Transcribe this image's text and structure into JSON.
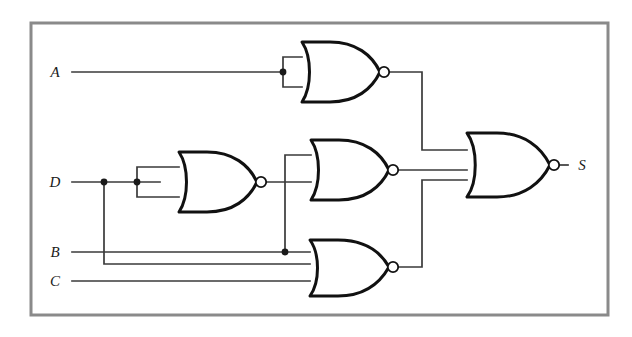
{
  "figure": {
    "kind": "logic-circuit-diagram",
    "title": "",
    "background_color": "#ffffff",
    "border_color": "#8a8a8a",
    "wire_color": "#3a3a3a",
    "gate_outline_color": "#111111",
    "label_color": "#1a1a1a"
  },
  "inputs": [
    {
      "id": "A",
      "label": "A",
      "y": 72
    },
    {
      "id": "D",
      "label": "D",
      "y": 182
    },
    {
      "id": "B",
      "label": "B",
      "y": 252
    },
    {
      "id": "C",
      "label": "C",
      "y": 281
    }
  ],
  "outputs": [
    {
      "id": "S",
      "label": "S",
      "y": 165
    }
  ],
  "gates": [
    {
      "id": "g1",
      "type": "NOR",
      "role": "inverter-A",
      "inputs": [
        "A",
        "A"
      ],
      "tied_inputs": true,
      "input_count": 2,
      "output": "nA",
      "x": 283,
      "y": 72
    },
    {
      "id": "g2",
      "type": "NOR",
      "role": "inverter-D",
      "inputs": [
        "D",
        "D"
      ],
      "tied_inputs": true,
      "input_count": 2,
      "output": "nD",
      "x": 160,
      "y": 182
    },
    {
      "id": "g3",
      "type": "NOR",
      "role": "mid",
      "inputs": [
        "B",
        "nD"
      ],
      "tied_inputs": false,
      "input_count": 2,
      "output": "m",
      "x": 290,
      "y": 170
    },
    {
      "id": "g4",
      "type": "NOR",
      "role": "bottom",
      "inputs": [
        "B",
        "D",
        "C"
      ],
      "tied_inputs": false,
      "input_count": 3,
      "output": "b",
      "x": 290,
      "y": 267
    },
    {
      "id": "g5",
      "type": "NOR",
      "role": "output",
      "inputs": [
        "nA",
        "m",
        "b"
      ],
      "tied_inputs": false,
      "input_count": 3,
      "output": "S",
      "x": 452,
      "y": 165
    }
  ],
  "junctions": [
    {
      "id": "j-a-tie",
      "signal": "A",
      "x": 283,
      "y": 72
    },
    {
      "id": "j-d-branch",
      "signal": "D",
      "x": 104,
      "y": 182
    },
    {
      "id": "j-d-tie",
      "signal": "D",
      "x": 137,
      "y": 182
    },
    {
      "id": "j-b-branch",
      "signal": "B",
      "x": 285,
      "y": 252
    }
  ],
  "nets": [
    {
      "id": "net-A",
      "from": "A",
      "to": "g1"
    },
    {
      "id": "net-D",
      "from": "D",
      "to": "g2"
    },
    {
      "id": "net-Dbr",
      "from": "D",
      "to": "g4"
    },
    {
      "id": "net-B",
      "from": "B",
      "to": "g4"
    },
    {
      "id": "net-Bbr",
      "from": "B",
      "to": "g3"
    },
    {
      "id": "net-C",
      "from": "C",
      "to": "g4"
    },
    {
      "id": "net-nA",
      "from": "g1",
      "to": "g5"
    },
    {
      "id": "net-nD",
      "from": "g2",
      "to": "g3"
    },
    {
      "id": "net-m",
      "from": "g3",
      "to": "g5"
    },
    {
      "id": "net-b",
      "from": "g4",
      "to": "g5"
    },
    {
      "id": "net-S",
      "from": "g5",
      "to": "S"
    }
  ]
}
